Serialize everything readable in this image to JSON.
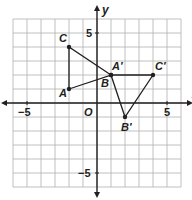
{
  "diagram": {
    "type": "coordinate-plane",
    "axes": {
      "x_label": "x",
      "y_label": "y",
      "origin_label": "O",
      "tick_labels": {
        "x_neg": "−5",
        "x_pos": "5",
        "y_pos": "5",
        "y_neg": "−5"
      },
      "range": {
        "xmin": -6,
        "xmax": 6,
        "ymin": -6,
        "ymax": 6
      }
    },
    "colors": {
      "grid": "#b0b0b0",
      "axis": "#231f20",
      "shape": "#231f20"
    },
    "triangle_original": {
      "vertices": [
        {
          "label": "A",
          "x": -2,
          "y": 1
        },
        {
          "label": "B",
          "x": 1,
          "y": 2
        },
        {
          "label": "C",
          "x": -2,
          "y": 4
        }
      ]
    },
    "triangle_image": {
      "vertices": [
        {
          "label": "A′",
          "x": 1,
          "y": 2
        },
        {
          "label": "B′",
          "x": 2,
          "y": -1
        },
        {
          "label": "C′",
          "x": 4,
          "y": 2
        }
      ]
    }
  }
}
